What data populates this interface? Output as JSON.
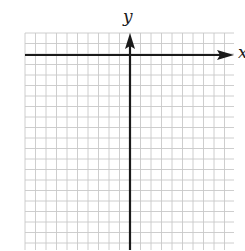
{
  "figure": {
    "type": "coordinate-plane",
    "axes": {
      "x_label": "x",
      "y_label": "y"
    },
    "grid": {
      "left": 25,
      "top": 33,
      "right": 234,
      "bottom": 250,
      "spacing": 10.5,
      "line_color": "#c8c8c8"
    },
    "origin": {
      "x": 130,
      "y": 55
    },
    "axis_color": "#1a1a1a"
  }
}
